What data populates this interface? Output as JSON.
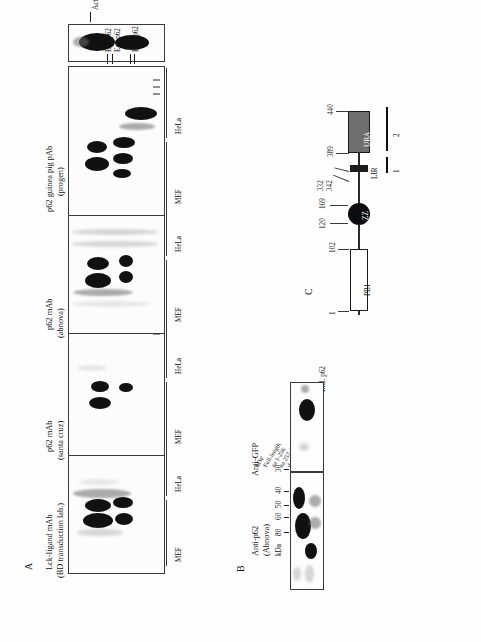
{
  "figure": {
    "panels": [
      "A",
      "B",
      "C"
    ],
    "letterA": "A",
    "letterB": "B",
    "letterC": "C"
  },
  "panelA": {
    "blots": [
      {
        "antibody_line1": "Lck-ligand mAb",
        "antibody_line2": "(BD transduction lab.)",
        "lanes": [
          "GFP",
          "GFP-His-p62",
          "GFP-Nte-p62",
          "GFP",
          "GFP-His-p62",
          "MW"
        ]
      },
      {
        "antibody_line1": "p62 mAb",
        "antibody_line2": "(santa cruz)",
        "lanes": [
          "GFP",
          "GFP-His-p62",
          "GFP-Nte-p62",
          "GFP",
          "GFP-His-p62",
          "MW"
        ]
      },
      {
        "antibody_line1": "p62 mAb",
        "antibody_line2": "(abnova)",
        "lanes": [
          "GFP",
          "GFP-His-p62",
          "GFP-Nte-p62",
          "GFP",
          "GFP-His-p62",
          "MW"
        ]
      },
      {
        "antibody_line1": "p62 guinea pig pAb",
        "antibody_line2": "(progen)",
        "lanes": [
          "GFP",
          "GFP-His-p62",
          "GFP-Nte-p62",
          "GFP",
          "GFP-His-p62",
          "MW"
        ]
      }
    ],
    "band_annotations": [
      "Ect. p62",
      "Ect. p62",
      "End. p62"
    ],
    "actin_annotation": "Actin",
    "cell_lines": [
      "HeLa",
      "MEF"
    ]
  },
  "panelB": {
    "blot_labels": [
      "Anti-p62\n(Abnova)",
      "Anti-GFP"
    ],
    "antip62_line1": "Anti-p62",
    "antip62_line2": "(Abnova)",
    "antigfp": "Anti-GFP",
    "kda_label": "kDa",
    "ladder": [
      "80",
      "60",
      "50",
      "40",
      "30"
    ],
    "lanes": [
      "MW",
      "Full-length",
      "aa 1-256",
      "aa 257-440",
      "del 123-440",
      "aa 123-169",
      "aa 1-385"
    ],
    "lane_right_label": "End. p62"
  },
  "panelC": {
    "domains": [
      {
        "name": "PB1",
        "start": 1,
        "end": 102
      },
      {
        "name": "ZZ",
        "start": 120,
        "end": 169
      },
      {
        "name": "LIR",
        "start": 332,
        "end": 342
      },
      {
        "name": "UBA",
        "start": 389,
        "end": 440
      }
    ],
    "positions": [
      "1",
      "102",
      "120",
      "169",
      "332",
      "342",
      "389",
      "440"
    ],
    "epitope_bars": [
      "1",
      "2"
    ]
  },
  "colors": {
    "uba_fill": "#6e6e6e",
    "lir_fill": "#1d1d1d",
    "zz_fill": "#0d0d0d",
    "pb1_fill": "#ffffff",
    "line": "#2a2a2a"
  }
}
